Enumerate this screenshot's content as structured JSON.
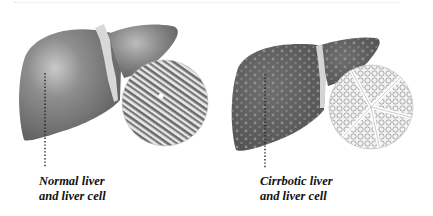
{
  "figure": {
    "panels": [
      {
        "id": "normal",
        "label_line1": "Normal liver",
        "label_line2": "and liver cell",
        "liver_color": "#7f7f7f",
        "texture": "smooth"
      },
      {
        "id": "cirrhotic",
        "label_line1": "Cirrbotic liver",
        "label_line2": "and liver cell",
        "liver_color": "#5f5f5f",
        "texture": "nodular"
      }
    ]
  }
}
